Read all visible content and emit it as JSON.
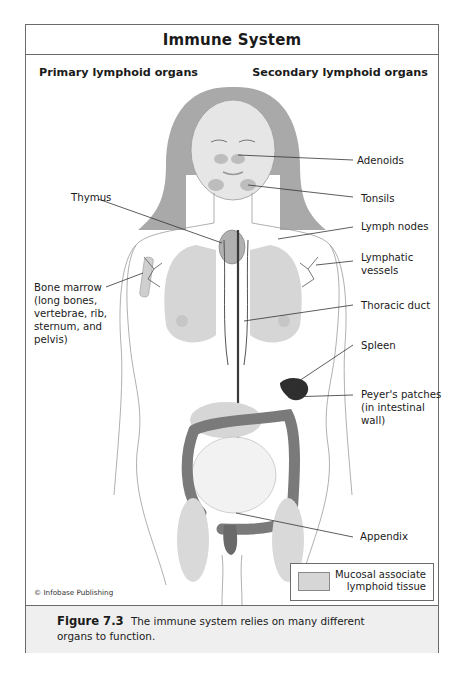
{
  "figure": {
    "title": "Immune System",
    "columns": {
      "left": "Primary lymphoid organs",
      "right": "Secondary lymphoid organs"
    },
    "labels": {
      "thymus": "Thymus",
      "bone_marrow": [
        "Bone marrow",
        "(long bones,",
        "vertebrae, rib,",
        "sternum, and",
        "pelvis)"
      ],
      "adenoids": "Adenoids",
      "tonsils": "Tonsils",
      "lymph_nodes": "Lymph nodes",
      "lymphatic_vessels": [
        "Lymphatic",
        "vessels"
      ],
      "thoracic_duct": "Thoracic duct",
      "spleen": "Spleen",
      "peyers_patches": [
        "Peyer's patches",
        "(in intestinal",
        "wall)"
      ],
      "appendix": "Appendix"
    },
    "legend": {
      "swatch_color": "#d6d6d6",
      "text": [
        "Mucosal associate",
        "lymphoid tissue"
      ]
    },
    "credit": "© Infobase Publishing"
  },
  "caption": {
    "figure_number": "Figure 7.3",
    "text": "The immune system relies on many different organs to function."
  },
  "colors": {
    "frame": "#6b6b6b",
    "caption_bg": "#efefef",
    "tissue": "#d6d6d6",
    "organ_dark": "#3a3a3a"
  }
}
